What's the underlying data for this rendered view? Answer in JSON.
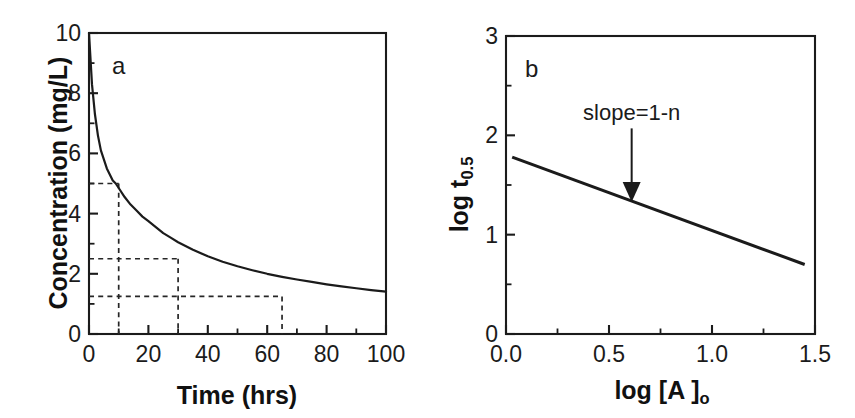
{
  "figure": {
    "background": "#ffffff",
    "ink_color": "#1b1b1b"
  },
  "chart_data": [
    {
      "id": "panel-a",
      "type": "line",
      "panel_label": "a",
      "title": "",
      "xlabel": "Time (hrs)",
      "ylabel": "Concentration (mg/L)",
      "xlim": [
        0,
        100
      ],
      "ylim": [
        0,
        10
      ],
      "grid": false,
      "legend": "none",
      "x_ticks_major": [
        0,
        20,
        40,
        60,
        80,
        100
      ],
      "x_ticklabels": [
        "0",
        "20",
        "40",
        "60",
        "80",
        "100"
      ],
      "x_ticks_minor": [
        10,
        30,
        50,
        70,
        90
      ],
      "y_ticks_major": [
        0,
        2,
        4,
        6,
        8,
        10
      ],
      "y_ticklabels": [
        "0",
        "2",
        "4",
        "6",
        "8",
        "10"
      ],
      "y_ticks_minor": [
        1,
        3,
        5,
        7,
        9
      ],
      "series": [
        {
          "name": "concentration-decay",
          "x": [
            0,
            1,
            2,
            3,
            4,
            5,
            6,
            7,
            8,
            9,
            10,
            12,
            14,
            16,
            18,
            20,
            22.5,
            25,
            27.5,
            30,
            35,
            40,
            45,
            50,
            55,
            60,
            65,
            70,
            75,
            80,
            85,
            90,
            95,
            100
          ],
          "y": [
            10.0,
            8.3,
            7.3,
            6.6,
            6.1,
            5.8,
            5.5,
            5.3,
            5.1,
            5.0,
            4.85,
            4.55,
            4.3,
            4.1,
            3.9,
            3.75,
            3.55,
            3.35,
            3.2,
            3.05,
            2.8,
            2.58,
            2.4,
            2.25,
            2.12,
            2.0,
            1.9,
            1.81,
            1.73,
            1.65,
            1.58,
            1.52,
            1.46,
            1.41
          ]
        }
      ],
      "guides": [
        {
          "name": "half-life-1",
          "concentration": 5.0,
          "time": 10
        },
        {
          "name": "half-life-2",
          "concentration": 2.5,
          "time": 30
        },
        {
          "name": "half-life-3",
          "concentration": 1.25,
          "time": 65
        }
      ]
    },
    {
      "id": "panel-b",
      "type": "line",
      "panel_label": "b",
      "title": "",
      "xlabel": "log [A ]o",
      "ylabel": "log t0.5",
      "xlim": [
        0.0,
        1.5
      ],
      "ylim": [
        0,
        3
      ],
      "grid": false,
      "legend": "none",
      "x_ticks_major": [
        0.0,
        0.5,
        1.0,
        1.5
      ],
      "x_ticklabels": [
        "0.0",
        "0.5",
        "1.0",
        "1.5"
      ],
      "x_ticks_minor": [
        0.25,
        0.75,
        1.25
      ],
      "y_ticks_major": [
        0,
        1,
        2,
        3
      ],
      "y_ticklabels": [
        "0",
        "1",
        "2",
        "3"
      ],
      "y_ticks_minor": [
        0.5,
        1.5,
        2.5
      ],
      "series": [
        {
          "name": "log-half-life-vs-log-initial-concentration",
          "x": [
            0.03,
            1.45
          ],
          "y": [
            1.78,
            0.7
          ]
        }
      ],
      "annotations": [
        {
          "name": "slope-annotation",
          "text": "slope=1-n",
          "x": 0.61,
          "y": 1.33,
          "label_y": 2.07
        }
      ]
    }
  ],
  "panel_a": {
    "label": "a",
    "y_axis_title": "Concentration (mg/L)",
    "x_axis_title": "Time (hrs)",
    "y_ticklabels": [
      "0",
      "2",
      "4",
      "6",
      "8",
      "10"
    ],
    "x_ticklabels": [
      "0",
      "20",
      "40",
      "60",
      "80",
      "100"
    ]
  },
  "panel_b": {
    "label": "b",
    "y_axis_title_main": "log t",
    "y_axis_title_sub": "0.5",
    "x_axis_title_main": "log [A ]",
    "x_axis_title_sub": "o",
    "y_ticklabels": [
      "0",
      "1",
      "2",
      "3"
    ],
    "x_ticklabels": [
      "0.0",
      "0.5",
      "1.0",
      "1.5"
    ],
    "annotation_text": "slope=1-n"
  }
}
